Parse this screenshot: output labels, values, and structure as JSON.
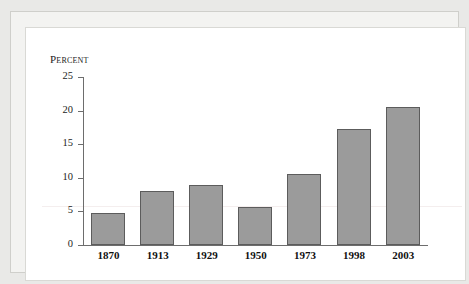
{
  "chart_data": {
    "type": "bar",
    "title": "",
    "ylabel": "Percent",
    "xlabel": "",
    "categories": [
      "1870",
      "1913",
      "1929",
      "1950",
      "1973",
      "1998",
      "2003"
    ],
    "values": [
      4.7,
      8.0,
      8.9,
      5.6,
      10.6,
      17.2,
      20.5
    ],
    "ylim": [
      0,
      25
    ],
    "yticks": [
      "0",
      "5",
      "10",
      "15",
      "20",
      "25"
    ],
    "ytick_values": [
      0,
      5,
      10,
      15,
      20,
      25
    ],
    "grid": false,
    "legend": null,
    "colors": {
      "bar_fill": "#9b9b9b",
      "bar_stroke": "#5c5c5c",
      "axis": "#6d6d6d",
      "text": "#1c1c1c",
      "panel_background": "#ffffff",
      "page_background": "#e9e9e7"
    }
  }
}
